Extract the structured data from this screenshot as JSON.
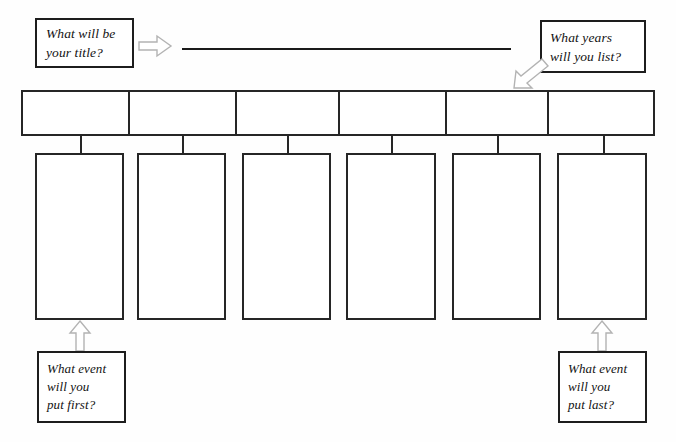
{
  "worksheet": {
    "title": "Timeline Worksheet",
    "background_color": "#fefefe",
    "ink_color": "#262626",
    "arrow_color": "#b3b3b3"
  },
  "title_prompt": {
    "name": "title-prompt",
    "line1": "What will be",
    "line2": "your title?"
  },
  "years_prompt": {
    "name": "years-prompt",
    "line1": "What years",
    "line2": "will you list?"
  },
  "first_prompt": {
    "name": "first-event-prompt",
    "line1": "What event",
    "line2": "will you",
    "line3": "put first?"
  },
  "last_prompt": {
    "name": "last-event-prompt",
    "line1": "What event",
    "line2": "will you",
    "line3": "put last?"
  },
  "title_line": {
    "value": "",
    "placeholder": ""
  },
  "arrows": [
    {
      "name": "arrow-to-title-line",
      "direction": "right"
    },
    {
      "name": "arrow-to-years-bar",
      "direction": "down-left"
    },
    {
      "name": "arrow-to-first-event-box",
      "direction": "up"
    },
    {
      "name": "arrow-to-last-event-box",
      "direction": "up"
    }
  ],
  "timeline": {
    "name": "year-bar",
    "cell_count": 6,
    "cells": [
      {
        "label": "",
        "width": 108
      },
      {
        "label": "",
        "width": 107
      },
      {
        "label": "",
        "width": 104
      },
      {
        "label": "",
        "width": 108
      },
      {
        "label": "",
        "width": 102
      },
      {
        "label": "",
        "width": 105
      }
    ]
  },
  "event_boxes": [
    {
      "label": "",
      "left": 35,
      "width": 89,
      "stem_x": 80
    },
    {
      "label": "",
      "left": 137,
      "width": 89,
      "stem_x": 182
    },
    {
      "label": "",
      "left": 242,
      "width": 89,
      "stem_x": 287
    },
    {
      "label": "",
      "left": 346,
      "width": 90,
      "stem_x": 391
    },
    {
      "label": "",
      "left": 452,
      "width": 89,
      "stem_x": 497
    },
    {
      "label": "",
      "left": 557,
      "width": 90,
      "stem_x": 603
    }
  ]
}
